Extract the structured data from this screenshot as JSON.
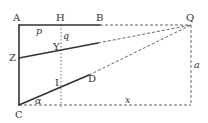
{
  "diagram": {
    "points": {
      "A": "A",
      "H": "H",
      "B": "B",
      "Q": "Q",
      "Z": "Z",
      "Y": "Y",
      "I": "I",
      "D": "D",
      "C": "C"
    },
    "variables": {
      "p": "p",
      "q": "q",
      "a": "a",
      "x": "x",
      "alpha": "α"
    }
  }
}
